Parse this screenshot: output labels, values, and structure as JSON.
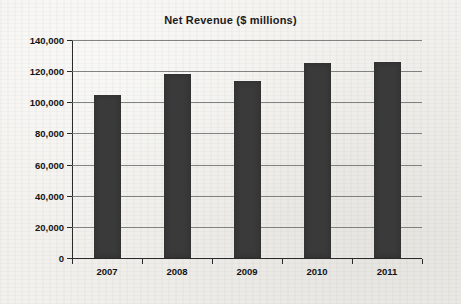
{
  "chart_data": {
    "type": "bar",
    "title": "Net Revenue ($ millions)",
    "xlabel": "",
    "ylabel": "",
    "categories": [
      "2007",
      "2008",
      "2009",
      "2010",
      "2011"
    ],
    "values": [
      104800,
      117900,
      113400,
      125000,
      126000
    ],
    "series": [
      {
        "name": "Net Revenue",
        "values": [
          104800,
          117900,
          113400,
          125000,
          126000
        ]
      }
    ],
    "ylim": [
      0,
      140000
    ],
    "y_tick_values": [
      0,
      20000,
      40000,
      60000,
      80000,
      100000,
      120000,
      140000
    ],
    "y_tick_labels": [
      "0",
      "20,000",
      "40,000",
      "60,000",
      "80,000",
      "100,000",
      "120,000",
      "140,000"
    ],
    "grid": true,
    "legend": false,
    "legend_position": "none",
    "bar_color": "#3a3a3a",
    "background_color": "#f2f1ed",
    "axis_color": "#2a2a2a",
    "gridline_color": "#6e6e6e"
  }
}
